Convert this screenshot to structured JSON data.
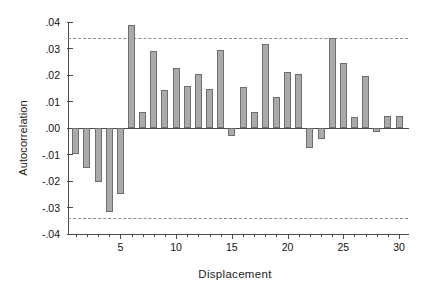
{
  "chart_data": {
    "type": "bar",
    "title": "",
    "subtitle": "",
    "xlabel": "Displacement",
    "ylabel": "Autocorrelation",
    "grid": false,
    "legend": null,
    "xlim": [
      0.3,
      30.8
    ],
    "ylim": [
      -0.04,
      0.04
    ],
    "x_tick_labels": [
      "5",
      "10",
      "15",
      "20",
      "25",
      "30"
    ],
    "x_tick_values": [
      5,
      10,
      15,
      20,
      25,
      30
    ],
    "x_minor_ticks": [
      1,
      2,
      3,
      4,
      6,
      7,
      8,
      9,
      11,
      12,
      13,
      14,
      16,
      17,
      18,
      19,
      21,
      22,
      23,
      24,
      26,
      27,
      28,
      29
    ],
    "y_tick_labels": [
      ".04",
      ".03",
      ".02",
      ".01",
      ".00",
      "-.01",
      "-.02",
      "-.03",
      "-.04"
    ],
    "y_tick_values": [
      0.04,
      0.03,
      0.02,
      0.01,
      0.0,
      -0.01,
      -0.02,
      -0.03,
      -0.04
    ],
    "categories": [
      1,
      2,
      3,
      4,
      5,
      6,
      7,
      8,
      9,
      10,
      11,
      12,
      13,
      14,
      15,
      16,
      17,
      18,
      19,
      20,
      21,
      22,
      23,
      24,
      25,
      26,
      27,
      28,
      29,
      30
    ],
    "values": [
      -0.0097,
      -0.0152,
      -0.0202,
      -0.0317,
      -0.0248,
      0.039,
      0.0061,
      0.029,
      0.0144,
      0.0225,
      0.0157,
      0.0202,
      0.0148,
      0.0295,
      -0.0031,
      0.0154,
      0.0059,
      0.0317,
      0.0116,
      0.021,
      0.0205,
      -0.0077,
      -0.0041,
      0.0338,
      0.0245,
      0.0043,
      0.0195,
      -0.0016,
      0.0046,
      0.0046
    ],
    "annotations": [
      {
        "name": "upper-confidence-bound",
        "value": 0.034,
        "style": "dashed"
      },
      {
        "name": "lower-confidence-bound",
        "value": -0.034,
        "style": "dashed"
      }
    ],
    "colors": {
      "bar_fill": "#aaaaaa",
      "bar_edge": "#6e6e6e",
      "axis": "#4a4a4a",
      "bound": "#8d8d8d",
      "background": "#ffffff",
      "text": "#111111"
    }
  }
}
